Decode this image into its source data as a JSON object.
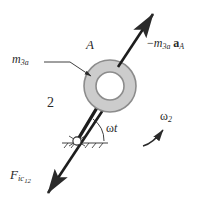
{
  "figure": {
    "background_color": "#ffffff",
    "stroke_color": "#2a2a2a",
    "body_fill_color": "#cccccc",
    "body_stroke_color": "#8c8c8c",
    "hub_fill_color": "#ffffff"
  },
  "labels": {
    "point_a": "A",
    "mass": {
      "symbol": "m",
      "subscript": "3a"
    },
    "link_number": "2",
    "angle": {
      "symbol": "ω",
      "variable": "t"
    },
    "angular_velocity": {
      "symbol": "ω",
      "subscript": "2"
    },
    "inertia_force_top": {
      "sign": "−",
      "mass_symbol": "m",
      "mass_subscript": "3a",
      "accel_symbol": "a",
      "accel_subscript": "A"
    },
    "inertia_force_bottom": {
      "symbol": "F",
      "subscript": "ic",
      "sub_subscript": "12"
    }
  },
  "geometry": {
    "ring_center": {
      "x": 110,
      "y": 86
    },
    "ring_outer_radius": 26,
    "ring_inner_radius": 14,
    "pivot": {
      "x": 77,
      "y": 141
    },
    "crank_angle_label": "ωt",
    "top_arrow": {
      "from_x": 118,
      "from_y": 66,
      "to_x": 155,
      "to_y": 10
    },
    "bottom_arrow": {
      "from_x": 103,
      "from_y": 110,
      "to_x": 46,
      "to_y": 196
    },
    "leader_line": {
      "from_x": 46,
      "from_y": 62,
      "to_x": 90,
      "to_y": 75
    },
    "omega2_arc_direction": "counterclockwise"
  }
}
